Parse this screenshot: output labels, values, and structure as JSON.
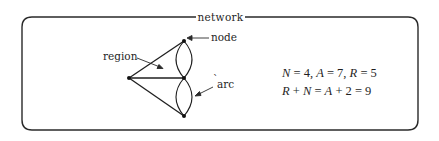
{
  "figure": {
    "title": "network",
    "labels": {
      "region": "region",
      "node": "node",
      "arc": "arc"
    },
    "graph": {
      "nodes": [
        {
          "id": "left",
          "x": 129,
          "y": 78
        },
        {
          "id": "top",
          "x": 184,
          "y": 41
        },
        {
          "id": "middle",
          "x": 184,
          "y": 78
        },
        {
          "id": "bottom",
          "x": 184,
          "y": 116
        }
      ],
      "arcs": [
        {
          "from": "left",
          "to": "top",
          "shape": "straight"
        },
        {
          "from": "left",
          "to": "middle",
          "shape": "straight"
        },
        {
          "from": "left",
          "to": "bottom",
          "shape": "straight"
        },
        {
          "from": "top",
          "to": "middle",
          "shape": "curve-left"
        },
        {
          "from": "top",
          "to": "middle",
          "shape": "curve-right"
        },
        {
          "from": "middle",
          "to": "bottom",
          "shape": "curve-left"
        },
        {
          "from": "middle",
          "to": "bottom",
          "shape": "curve-right"
        }
      ]
    },
    "equations": {
      "line1": "N = 4, A = 7, R = 5",
      "line2": "R + N = A + 2 = 9",
      "values": {
        "N": 4,
        "A": 7,
        "R": 5,
        "sum": 9
      }
    },
    "colors": {
      "stroke": "#1f1f1f",
      "background": "#ffffff"
    }
  }
}
